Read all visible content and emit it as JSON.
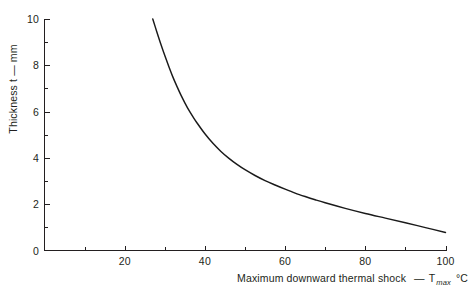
{
  "chart_data": {
    "type": "line",
    "title": "",
    "xlabel": "Maximum downward thermal shock  — T max °C",
    "ylabel": "Thickness t — mm",
    "xlim": [
      0,
      100
    ],
    "ylim": [
      0,
      10
    ],
    "grid": false,
    "legend": null,
    "x_major_ticks": [
      20,
      40,
      60,
      80,
      100
    ],
    "x_major_tick_labels": [
      "20",
      "40",
      "60",
      "80",
      "100"
    ],
    "x_minor_ticks": [
      10,
      30,
      50,
      70,
      90
    ],
    "y_major_ticks": [
      0,
      2,
      4,
      6,
      8,
      10
    ],
    "y_major_tick_labels": [
      "0",
      "2",
      "4",
      "6",
      "8",
      "10"
    ],
    "y_minor_ticks": [
      1,
      3,
      5,
      7,
      9
    ],
    "series": [
      {
        "name": "thickness-vs-thermal-shock",
        "x": [
          27.0,
          28.0,
          29.0,
          30.0,
          31.0,
          32.0,
          33.0,
          34.0,
          35.0,
          36.0,
          37.0,
          38.0,
          40.0,
          42.0,
          44.0,
          46.0,
          48.0,
          50.0,
          52.5,
          55.0,
          57.5,
          60.0,
          62.5,
          65.0,
          67.5,
          70.0,
          75.0,
          80.0,
          85.0,
          90.0,
          95.0,
          100.0
        ],
        "y": [
          10.0,
          9.45,
          8.92,
          8.42,
          7.95,
          7.5,
          7.1,
          6.72,
          6.38,
          6.06,
          5.78,
          5.52,
          5.04,
          4.63,
          4.28,
          3.98,
          3.72,
          3.49,
          3.24,
          3.02,
          2.83,
          2.65,
          2.48,
          2.33,
          2.19,
          2.06,
          1.82,
          1.6,
          1.4,
          1.2,
          0.99,
          0.78
        ]
      }
    ]
  },
  "axes": {
    "x_axis_name": "maximum-downward-thermal-shock",
    "y_axis_name": "thickness",
    "xlabel_main": "Maximum downward thermal shock",
    "xlabel_dash": "—",
    "xlabel_symbol": "T",
    "xlabel_subscript": "max",
    "xlabel_unit": "°C",
    "ylabel_text": "Thickness t — mm"
  },
  "style": {
    "axis_color": "#231f20",
    "curve_color": "#1a1a1a",
    "background": "#ffffff"
  }
}
